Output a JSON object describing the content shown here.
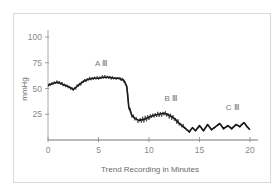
{
  "chart_data": {
    "type": "line",
    "title": "",
    "xlabel": "Trend Recording in Minutes",
    "ylabel": "mmHg",
    "xlim": [
      0,
      20
    ],
    "ylim": [
      0,
      100
    ],
    "x_ticks": [
      "0",
      "5",
      "10",
      "15",
      "20"
    ],
    "y_ticks": [
      "25",
      "50",
      "75",
      "100"
    ],
    "grid": false,
    "legend": null,
    "series": [
      {
        "name": "Pressure trend",
        "color": "#111111",
        "x": [
          0,
          0.5,
          1,
          1.5,
          2,
          2.5,
          3,
          3.5,
          4,
          4.5,
          5,
          5.5,
          6,
          6.5,
          7,
          7.5,
          7.8,
          8,
          8.3,
          8.6,
          9,
          9.5,
          10,
          10.5,
          11,
          11.5,
          12,
          12.5,
          13,
          13.5,
          14,
          14.3,
          14.6,
          15,
          15.4,
          15.8,
          16.2,
          16.6,
          17,
          17.4,
          17.8,
          18.2,
          18.6,
          19,
          19.4,
          19.7,
          20
        ],
        "values": [
          53,
          55,
          56,
          54,
          52,
          49,
          53,
          57,
          59,
          60,
          60,
          61,
          61,
          60,
          60,
          58,
          52,
          32,
          24,
          21,
          19,
          20,
          22,
          24,
          25,
          26,
          24,
          21,
          16,
          12,
          8,
          12,
          9,
          14,
          9,
          15,
          10,
          13,
          16,
          11,
          14,
          11,
          15,
          13,
          17,
          13,
          10
        ]
      }
    ],
    "annotations": [
      {
        "label": "A Ⅲ",
        "x": 5.3,
        "y": 72
      },
      {
        "label": "B Ⅲ",
        "x": 12.2,
        "y": 38
      },
      {
        "label": "C Ⅲ",
        "x": 18.3,
        "y": 29
      }
    ]
  }
}
